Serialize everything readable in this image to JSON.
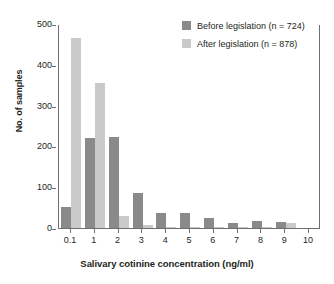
{
  "chart_data": {
    "type": "bar",
    "title": "",
    "xlabel": "Salivary cotinine concentration (ng/ml)",
    "ylabel": "No. of samples",
    "ylim": [
      0,
      500
    ],
    "yticks": [
      0,
      100,
      200,
      300,
      400,
      500
    ],
    "ytick_labels": [
      "0",
      "100",
      "200",
      "300",
      "400",
      "500"
    ],
    "categories": [
      "0.1",
      "1",
      "2",
      "3",
      "4",
      "5",
      "6",
      "7",
      "8",
      "9",
      "10"
    ],
    "xtick_labels": [
      "0.1",
      "1",
      "2",
      "3",
      "4",
      "5",
      "6",
      "7",
      "8",
      "9",
      "10"
    ],
    "grid": false,
    "legend_position": "top-right",
    "series": [
      {
        "name": "Before legislation (n = 724)",
        "color": "#8a8a8a",
        "values": [
          52,
          220,
          222,
          85,
          38,
          36,
          25,
          13,
          16,
          14,
          0
        ]
      },
      {
        "name": "After legislation (n = 878)",
        "color": "#c9c9c9",
        "values": [
          465,
          355,
          29,
          8,
          2,
          1,
          1,
          1,
          1,
          13,
          0
        ]
      }
    ]
  },
  "legend": {
    "items": [
      {
        "label": "Before legislation (n = 724)",
        "swatch": "before"
      },
      {
        "label": "After legislation (n = 878)",
        "swatch": "after"
      }
    ]
  },
  "axes": {
    "y_title": "No. of samples",
    "x_title": "Salivary cotinine concentration (ng/ml)"
  }
}
